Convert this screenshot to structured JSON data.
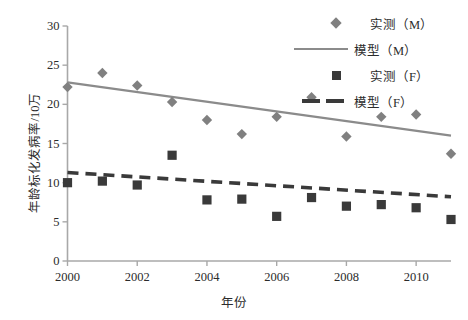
{
  "chart_data": {
    "type": "scatter",
    "title": "",
    "xlabel": "年份",
    "ylabel": "年龄标化发病率/10万",
    "xlim": [
      2000,
      2011
    ],
    "ylim": [
      0,
      30
    ],
    "xticks": [
      "2000",
      "2002",
      "2004",
      "2006",
      "2008",
      "2010"
    ],
    "xtick_values": [
      2000,
      2002,
      2004,
      2006,
      2008,
      2010
    ],
    "yticks": [
      "0",
      "5",
      "10",
      "15",
      "20",
      "25",
      "30"
    ],
    "ytick_values": [
      0,
      5,
      10,
      15,
      20,
      25,
      30
    ],
    "grid": false,
    "legend_position": "top-right",
    "x": [
      2000,
      2001,
      2002,
      2003,
      2004,
      2005,
      2006,
      2007,
      2008,
      2009,
      2010,
      2011
    ],
    "series": [
      {
        "name": "实测（M）",
        "kind": "scatter",
        "marker": "diamond",
        "color": "#808080",
        "values": [
          22.2,
          24.0,
          22.4,
          20.3,
          18.0,
          16.2,
          18.4,
          20.9,
          15.9,
          18.4,
          18.7,
          13.7
        ]
      },
      {
        "name": "模型（M）",
        "kind": "line",
        "style": "solid",
        "color": "#8b8b8b",
        "endpoints": [
          22.8,
          16.0
        ],
        "values": [
          22.8,
          22.18,
          21.56,
          20.95,
          20.33,
          19.71,
          19.09,
          18.47,
          17.85,
          17.24,
          16.62,
          16.0
        ]
      },
      {
        "name": "实测（F）",
        "kind": "scatter",
        "marker": "square",
        "color": "#3a3a3a",
        "values": [
          10.0,
          10.2,
          9.7,
          13.5,
          7.8,
          7.9,
          5.7,
          8.1,
          7.0,
          7.2,
          6.8,
          5.3
        ]
      },
      {
        "name": "模型（F）",
        "kind": "line",
        "style": "dashed",
        "color": "#3a3a3a",
        "endpoints": [
          11.3,
          8.2
        ],
        "values": [
          11.3,
          11.02,
          10.74,
          10.45,
          10.17,
          9.89,
          9.61,
          9.33,
          9.05,
          8.76,
          8.48,
          8.2
        ]
      }
    ]
  },
  "axes": {
    "y_title": "年龄标化发病率/10万",
    "x_title": "年份",
    "ytick_labels": [
      "30",
      "25",
      "20",
      "15",
      "10",
      "5",
      "0"
    ],
    "xtick_labels": [
      "2000",
      "2002",
      "2004",
      "2006",
      "2008",
      "2010"
    ]
  },
  "legend": {
    "items": [
      {
        "label": "实测（M）",
        "key": "marker-diamond-gray"
      },
      {
        "label": "模型（M）",
        "key": "line-solid-gray"
      },
      {
        "label": "实测（F）",
        "key": "marker-square-dark"
      },
      {
        "label": "模型（F）",
        "key": "line-dashed-dark"
      }
    ]
  },
  "colors": {
    "male_marker": "#808080",
    "male_line": "#8b8b8b",
    "female_marker": "#3a3a3a",
    "female_line": "#3a3a3a",
    "axis": "#a8a8a8",
    "text": "#2b2b2b"
  }
}
